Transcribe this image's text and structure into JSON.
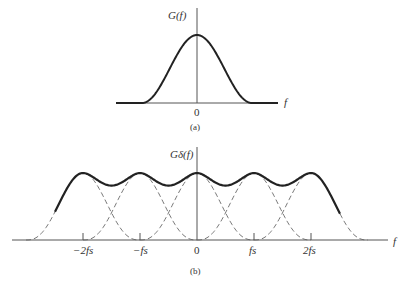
{
  "panel_a": {
    "ylabel": "G(f)",
    "xlabel": "f",
    "tick_zero": "0",
    "caption": "(a)"
  },
  "panel_b": {
    "ylabel": "Gδ(f)",
    "xlabel": "f",
    "ticks": [
      "−2fs",
      "−fs",
      "0",
      "fs",
      "2fs"
    ],
    "caption": "(b)"
  },
  "colors": {
    "ink": "#333333",
    "axis": "#555555",
    "dashed": "#666666"
  }
}
